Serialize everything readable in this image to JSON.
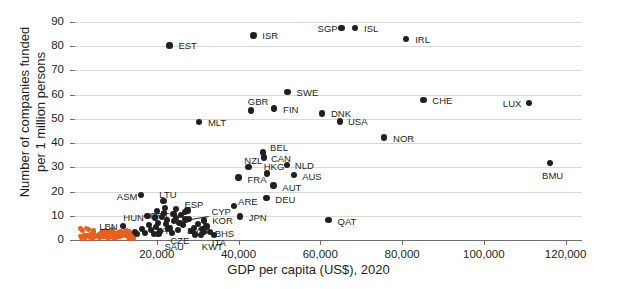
{
  "chart_data": {
    "type": "scatter",
    "title": "",
    "subtitle": "",
    "xlabel": "GDP per capita (US$), 2020",
    "ylabel": "Number of companies funded\nper 1 million persons",
    "ylabel_line1": "Number of companies funded",
    "ylabel_line2": "per 1 million persons",
    "xlim": [
      0,
      124000
    ],
    "ylim": [
      0,
      90
    ],
    "xticks": [
      20000,
      40000,
      60000,
      80000,
      100000,
      120000
    ],
    "xtick_labels": [
      "20,000",
      "40,000",
      "60,000",
      "80,000",
      "100,000",
      "120,000"
    ],
    "yticks": [
      0,
      10,
      20,
      30,
      40,
      50,
      60,
      70,
      80,
      90
    ],
    "ytick_labels": [
      "0",
      "10",
      "20",
      "30",
      "40",
      "50",
      "60",
      "70",
      "80",
      "90"
    ],
    "grid": "horizontal",
    "legend": "none",
    "colors": {
      "highlight": "#231f20",
      "cluster": "#e8601c",
      "grid": "#d9d9d9",
      "axis": "#6d6e71"
    },
    "series": [
      {
        "name": "Labeled economies",
        "color": "#231f20",
        "points": [
          {
            "label": "EST",
            "x": 23100,
            "y": 80.3,
            "lx": 9,
            "ly": -4
          },
          {
            "label": "ISR",
            "x": 43600,
            "y": 84.5,
            "lx": 9,
            "ly": -4
          },
          {
            "label": "SGP",
            "x": 65200,
            "y": 87.5,
            "lx": -24,
            "ly": -4
          },
          {
            "label": "ISL",
            "x": 68500,
            "y": 87.5,
            "lx": 9,
            "ly": -4
          },
          {
            "label": "IRL",
            "x": 81000,
            "y": 83.0,
            "lx": 9,
            "ly": -4
          },
          {
            "label": "SWE",
            "x": 52000,
            "y": 61.2,
            "lx": 9,
            "ly": -4
          },
          {
            "label": "GBR",
            "x": 43000,
            "y": 53.4,
            "lx": -3,
            "ly": -14
          },
          {
            "label": "FIN",
            "x": 48700,
            "y": 54.2,
            "lx": 9,
            "ly": -4
          },
          {
            "label": "DNK",
            "x": 60400,
            "y": 52.3,
            "lx": 9,
            "ly": -4
          },
          {
            "label": "USA",
            "x": 64800,
            "y": 49.0,
            "lx": 8,
            "ly": -4
          },
          {
            "label": "CHE",
            "x": 85200,
            "y": 57.8,
            "lx": 9,
            "ly": -4
          },
          {
            "label": "LUX",
            "x": 111000,
            "y": 56.5,
            "lx": -26,
            "ly": -4
          },
          {
            "label": "MLT",
            "x": 30300,
            "y": 48.8,
            "lx": 9,
            "ly": -4
          },
          {
            "label": "NOR",
            "x": 75600,
            "y": 42.3,
            "lx": 9,
            "ly": -4
          },
          {
            "label": "BMU",
            "x": 116200,
            "y": 31.8,
            "lx": -8,
            "ly": 8
          },
          {
            "label": "BEL",
            "x": 46000,
            "y": 36.2,
            "lx": 7,
            "ly": -9
          },
          {
            "label": "CAN",
            "x": 46200,
            "y": 34.0,
            "lx": 7,
            "ly": -4
          },
          {
            "label": "NZL",
            "x": 42400,
            "y": 30.2,
            "lx": -4,
            "ly": -11
          },
          {
            "label": "NLD",
            "x": 51800,
            "y": 31.0,
            "lx": 8,
            "ly": -4
          },
          {
            "label": "HKG",
            "x": 46900,
            "y": 27.5,
            "lx": -3,
            "ly": -11
          },
          {
            "label": "AUS",
            "x": 53600,
            "y": 26.8,
            "lx": 8,
            "ly": -3
          },
          {
            "label": "FRA",
            "x": 40000,
            "y": 25.8,
            "lx": 9,
            "ly": -3
          },
          {
            "label": "AUT",
            "x": 48500,
            "y": 22.5,
            "lx": 9,
            "ly": -3
          },
          {
            "label": "DEU",
            "x": 46800,
            "y": 17.4,
            "lx": 9,
            "ly": -3
          },
          {
            "label": "ARE",
            "x": 38900,
            "y": 14.0,
            "lx": 4,
            "ly": -9
          },
          {
            "label": "JPN",
            "x": 40300,
            "y": 9.8,
            "lx": 9,
            "ly": -3
          },
          {
            "label": "QAT",
            "x": 62000,
            "y": 8.2,
            "lx": 9,
            "ly": -3
          },
          {
            "label": "ASM",
            "x": 16100,
            "y": 18.5,
            "lx": -24,
            "ly": -3
          },
          {
            "label": "LTU",
            "x": 21600,
            "y": 16.1,
            "lx": -4,
            "ly": -11
          },
          {
            "label": "ESP",
            "x": 27500,
            "y": 12.1,
            "lx": -3,
            "ly": -11
          },
          {
            "label": "PRT",
            "x": 24100,
            "y": 10.8,
            "lx": -23,
            "ly": -3
          },
          {
            "label": "HUN",
            "x": 17700,
            "y": 10.0,
            "lx": -24,
            "ly": -3
          },
          {
            "label": "LVA",
            "x": 19600,
            "y": 9.2,
            "lx": -4,
            "ly": 8
          },
          {
            "label": "CYP",
            "x": 27000,
            "y": 8.4,
            "lx": 26,
            "ly": -13
          },
          {
            "label": "KOR",
            "x": 31600,
            "y": 8.0,
            "lx": 8,
            "ly": -5
          },
          {
            "label": "SVN",
            "x": 25600,
            "y": 7.0,
            "lx": 7,
            "ly": 3
          },
          {
            "label": "BHS",
            "x": 32200,
            "y": 5.6,
            "lx": 8,
            "ly": 3
          },
          {
            "label": "CZE",
            "x": 22800,
            "y": 4.8,
            "lx": 2,
            "ly": 8
          },
          {
            "label": "ITA",
            "x": 31500,
            "y": 3.4,
            "lx": 8,
            "ly": 6
          },
          {
            "label": "SAU",
            "x": 20400,
            "y": 2.5,
            "lx": 6,
            "ly": 8
          },
          {
            "label": "KWT",
            "x": 29300,
            "y": 2.3,
            "lx": 7,
            "ly": 8
          },
          {
            "label": "LBN",
            "x": 11800,
            "y": 5.8,
            "lx": -24,
            "ly": -4
          }
        ],
        "unlabeled_points": [
          {
            "x": 14600,
            "y": 3.2
          },
          {
            "x": 15200,
            "y": 2.6
          },
          {
            "x": 16500,
            "y": 4.5
          },
          {
            "x": 17200,
            "y": 3.0
          },
          {
            "x": 18000,
            "y": 6.2
          },
          {
            "x": 18600,
            "y": 4.0
          },
          {
            "x": 19200,
            "y": 2.4
          },
          {
            "x": 19900,
            "y": 5.4
          },
          {
            "x": 20200,
            "y": 7.1
          },
          {
            "x": 20800,
            "y": 3.8
          },
          {
            "x": 21200,
            "y": 9.4
          },
          {
            "x": 21800,
            "y": 11.0
          },
          {
            "x": 22300,
            "y": 6.5
          },
          {
            "x": 22600,
            "y": 8.3
          },
          {
            "x": 23200,
            "y": 5.1
          },
          {
            "x": 23800,
            "y": 2.8
          },
          {
            "x": 24300,
            "y": 7.8
          },
          {
            "x": 24800,
            "y": 9.0
          },
          {
            "x": 25200,
            "y": 4.2
          },
          {
            "x": 25900,
            "y": 10.2
          },
          {
            "x": 26400,
            "y": 6.0
          },
          {
            "x": 26900,
            "y": 11.4
          },
          {
            "x": 27900,
            "y": 8.8
          },
          {
            "x": 28400,
            "y": 3.6
          },
          {
            "x": 29000,
            "y": 5.0
          },
          {
            "x": 30100,
            "y": 6.8
          },
          {
            "x": 30800,
            "y": 2.2
          },
          {
            "x": 31000,
            "y": 4.4
          },
          {
            "x": 33000,
            "y": 3.1
          },
          {
            "x": 34000,
            "y": 2.0
          },
          {
            "x": 24600,
            "y": 12.6
          },
          {
            "x": 22100,
            "y": 13.4
          },
          {
            "x": 20000,
            "y": 12.0
          }
        ]
      },
      {
        "name": "Other economies",
        "color": "#e8601c",
        "description": "Dense low-GDP cluster near the x-axis",
        "point_count": 140
      }
    ]
  }
}
